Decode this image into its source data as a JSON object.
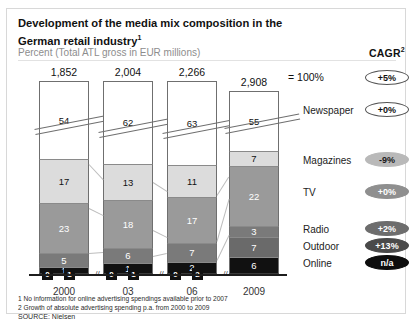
{
  "header": {
    "title": "Development of the media mix composition in the German retail industry",
    "title_sup": "1",
    "subtitle": "Percent (Total ATL gross in EUR millions)",
    "cagr_label": "CAGR",
    "cagr_sup": "2",
    "eq_100": "= 100%"
  },
  "footer": {
    "note1": "1 No information for online advertising spendings available prior to 2007",
    "note2": "2 Growth of absolute advertising spending p.a. from 2000 to 2009",
    "source": "SOURCE: Nielsen"
  },
  "categories": [
    {
      "name": "Newspaper",
      "cagr": "+5%"
    },
    {
      "name": "Magazines",
      "cagr": "+0%"
    },
    {
      "name": "TV",
      "cagr": "-9%"
    },
    {
      "name": "Radio",
      "cagr": "+0%"
    },
    {
      "name": "Outdoor",
      "cagr": "+2%"
    },
    {
      "name": "Online",
      "cagr": "+13%"
    }
  ],
  "cagr_badges": [
    {
      "value": "+5%",
      "fill": "#ffffff",
      "text": "#111111"
    },
    {
      "value": "+0%",
      "fill": "#ffffff",
      "text": "#111111"
    },
    {
      "value": "-9%",
      "fill": "#b9b9b9",
      "text": "#1a1a1a"
    },
    {
      "value": "+0%",
      "fill": "#8f8f8f",
      "text": "#ffffff"
    },
    {
      "value": "+2%",
      "fill": "#6d6d6d",
      "text": "#ffffff"
    },
    {
      "value": "+13%",
      "fill": "#4a4a4a",
      "text": "#ffffff"
    },
    {
      "value": "n/a",
      "fill": "#0d0d0d",
      "text": "#ffffff"
    }
  ],
  "chart_data": {
    "type": "bar",
    "title": "Development of the media mix composition in the German retail industry",
    "subtitle": "Percent (Total ATL gross in EUR millions)",
    "xlabel": "",
    "ylabel": "Percent",
    "ylim": [
      0,
      100
    ],
    "stacked": true,
    "grid": false,
    "legend_position": "right",
    "categories": [
      "2000",
      "03",
      "06",
      "2009"
    ],
    "totals": [
      "1,852",
      "2,004",
      "2,266",
      "2,908"
    ],
    "series": [
      {
        "name": "Newspaper",
        "values": [
          54,
          62,
          63,
          55
        ],
        "color": "#ffffff",
        "text": "#111111"
      },
      {
        "name": "Magazines",
        "values": [
          17,
          13,
          11,
          7
        ],
        "color": "#dcdcdc",
        "text": "#111111"
      },
      {
        "name": "TV",
        "values": [
          23,
          18,
          17,
          22
        ],
        "color": "#9a9a9a",
        "text": "#ffffff"
      },
      {
        "name": "Radio",
        "values": [
          5,
          6,
          7,
          3
        ],
        "color": "#7a7a7a",
        "text": "#ffffff"
      },
      {
        "name": "Outdoor",
        "values": [
          0,
          0,
          0,
          7
        ],
        "color": "#6a6a6a",
        "text": "#ffffff"
      },
      {
        "name": "Online",
        "values": [
          1,
          1,
          2,
          6
        ],
        "color": "#111111",
        "text": "#ffffff"
      }
    ],
    "axis_chips": [
      {
        "bar": "2000",
        "labels": [
          "0",
          "1"
        ]
      },
      {
        "bar": "03",
        "labels": [
          "0",
          "1"
        ]
      },
      {
        "bar": "06",
        "labels": [
          "0",
          "2"
        ]
      },
      {
        "bar": "2009",
        "labels": []
      }
    ]
  }
}
